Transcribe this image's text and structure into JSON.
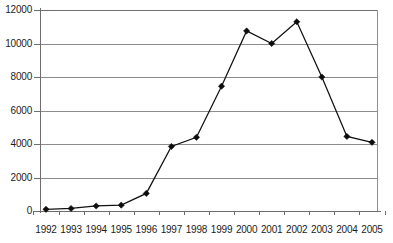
{
  "chart_data": {
    "type": "line",
    "title": "",
    "subtitle": "",
    "xlabel": "",
    "ylabel": "",
    "categories": [
      "1992",
      "1993",
      "1994",
      "1995",
      "1996",
      "1997",
      "1998",
      "1999",
      "2000",
      "2001",
      "2002",
      "2003",
      "2004",
      "2005"
    ],
    "values": [
      100,
      150,
      300,
      350,
      1050,
      3850,
      4400,
      7450,
      10750,
      10000,
      11300,
      8000,
      4450,
      4100
    ],
    "series": [
      {
        "name": "series-1",
        "marker": "diamond",
        "color": "#111111",
        "values": [
          100,
          150,
          300,
          350,
          1050,
          3850,
          4400,
          7450,
          10750,
          10000,
          11300,
          8000,
          4450,
          4100
        ]
      }
    ],
    "ylim": [
      0,
      12000
    ],
    "ytick_values": [
      0,
      2000,
      4000,
      6000,
      8000,
      10000,
      12000
    ],
    "ytick_labels": [
      "0",
      "2000",
      "4000",
      "6000",
      "8000",
      "10000",
      "12000"
    ],
    "grid": true,
    "grid_axis": "y",
    "legend": false,
    "legend_position": "none",
    "gridline_color": "#8c8c8c",
    "axis_color": "#6d6d6d",
    "background": "#ffffff"
  }
}
